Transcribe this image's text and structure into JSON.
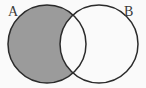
{
  "figure": {
    "kind": "venn-diagram",
    "caption": "",
    "background_color": "#fafafa",
    "width": 146,
    "height": 88
  },
  "sets": [
    {
      "id": "A",
      "label": "A",
      "label_position": "top-left-outside",
      "center": {
        "x": 47,
        "y": 44
      },
      "radius": 39,
      "stroke_color": "#2b2b2b",
      "stroke_width": 1.5,
      "fill": "none"
    },
    {
      "id": "B",
      "label": "B",
      "label_position": "top-right-outside",
      "center": {
        "x": 99,
        "y": 44
      },
      "radius": 39,
      "stroke_color": "#2b2b2b",
      "stroke_width": 1.5,
      "fill": "none"
    }
  ],
  "regions": [
    {
      "id": "A-only",
      "name": "A minus B",
      "description": "left lune of circle A, excluding the overlap",
      "shaded": true,
      "fill_color": "#9b9b9b"
    },
    {
      "id": "A-and-B",
      "name": "A intersect B",
      "description": "central lens where the two circles overlap",
      "shaded": false,
      "fill_color": "#fafafa"
    },
    {
      "id": "B-only",
      "name": "B minus A",
      "description": "right lune of circle B, excluding the overlap",
      "shaded": false,
      "fill_color": "#fafafa"
    },
    {
      "id": "outside",
      "name": "complement of A union B",
      "description": "area outside both circles",
      "shaded": false,
      "fill_color": "#fafafa"
    }
  ],
  "intersection_points": [
    {
      "x": 73,
      "y": 12
    },
    {
      "x": 73,
      "y": 76
    }
  ],
  "shaded_set_expression": "A \\ B",
  "labels": {
    "left_set": "A",
    "right_set": "B"
  },
  "colors": {
    "shade": "#9b9b9b",
    "stroke": "#2b2b2b",
    "background": "#fafafa",
    "label_text": "#3a3a3a"
  }
}
